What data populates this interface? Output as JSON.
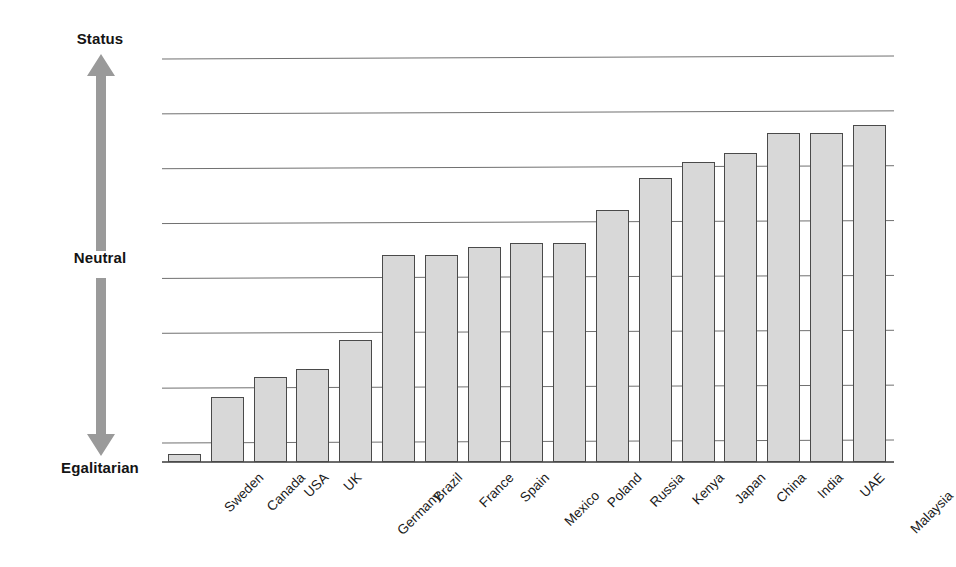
{
  "chart_data": {
    "type": "bar",
    "title": "",
    "subtitle": "",
    "xlabel": "",
    "ylabel": "",
    "legend": [],
    "grid": true,
    "gridlines": 8,
    "axis_anchor_labels": {
      "top": "Status",
      "middle": "Neutral",
      "bottom": "Egalitarian"
    },
    "ylim": [
      0,
      100
    ],
    "categories": [
      "Sweden",
      "Canada",
      "USA",
      "UK",
      "Germany",
      "Brazil",
      "France",
      "Spain",
      "Mexico",
      "Poland",
      "Russia",
      "Kenya",
      "Japan",
      "China",
      "India",
      "UAE",
      "Malaysia"
    ],
    "values": [
      2,
      16,
      21,
      23,
      30,
      51,
      51,
      53,
      54,
      54,
      62,
      70,
      74,
      76,
      81,
      81,
      83
    ],
    "series": [
      {
        "name": "Status orientation",
        "values": [
          2,
          16,
          21,
          23,
          30,
          51,
          51,
          53,
          54,
          54,
          62,
          70,
          74,
          76,
          81,
          81,
          83
        ]
      }
    ],
    "bar_color": "#d8d8d8",
    "bar_border_color": "#4a4a4a",
    "gridline_color": "#707070",
    "arrow_color": "#9a9a9a"
  },
  "axis": {
    "status_label": "Status",
    "neutral_label": "Neutral",
    "egalitarian_label": "Egalitarian"
  }
}
